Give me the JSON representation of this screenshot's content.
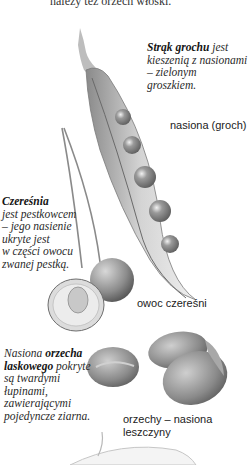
{
  "page": {
    "top_text": "należy też orzech włoski.",
    "pea": {
      "caption_bold": "Strąk grochu",
      "caption_rest": " jest kieszenią z nasionami – zielonym groszkiem.",
      "caption_lines": [
        "kieszenią z nasionami",
        "– zielonym",
        "groszkiem."
      ],
      "caption_first_suffix": " jest",
      "label": "nasiona (groch)"
    },
    "cherry": {
      "caption_bold": "Czereśnia",
      "caption_lines": [
        "jest pestkowcem",
        "– jego nasienie",
        "ukryte jest",
        "w części owocu",
        "zwanej pestką."
      ],
      "label": "owoc czereśni"
    },
    "hazelnut": {
      "caption_prefix": "Nasiona ",
      "caption_bold_1": "orzecha",
      "caption_bold_2": "laskowego",
      "caption_suffix": " pokryte",
      "caption_lines": [
        "są twardymi",
        "łupinami,",
        "zawierającymi",
        "pojedyncze ziarna."
      ],
      "label_lines": [
        "orzechy – nasiona",
        "leszczyny"
      ]
    }
  }
}
